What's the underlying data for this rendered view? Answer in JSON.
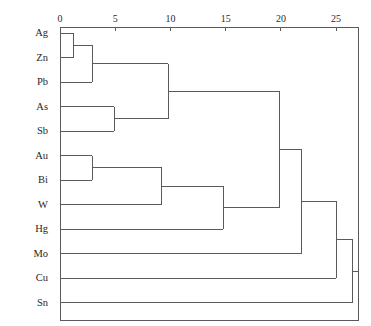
{
  "chart_data": {
    "type": "dendrogram",
    "title": "",
    "xlabel": "",
    "ylabel": "",
    "axis_position": "top",
    "grid": false,
    "legend": false,
    "xlim": [
      0,
      26.8
    ],
    "xticks": [
      0,
      5,
      10,
      15,
      20,
      25
    ],
    "xtick_labels": [
      "0",
      "5",
      "10",
      "15",
      "20",
      "25"
    ],
    "leaf_labels": [
      "Ag",
      "Zn",
      "Pb",
      "As",
      "Sb",
      "Au",
      "Bi",
      "W",
      "Hg",
      "Mo",
      "Cu",
      "Sn"
    ],
    "leaf_order": [
      "Ag",
      "Zn",
      "Pb",
      "As",
      "Sb",
      "Au",
      "Bi",
      "W",
      "Hg",
      "Mo",
      "Cu",
      "Sn"
    ],
    "orientation": "left-to-right",
    "line_color": "#5a5a5a",
    "axis_color": "#5a5a5a",
    "merges": [
      {
        "id": "m1",
        "left": "Ag",
        "right": "Zn",
        "height": 1.2,
        "members": [
          "Ag",
          "Zn"
        ]
      },
      {
        "id": "m2",
        "left": "m1",
        "right": "Pb",
        "height": 2.9,
        "members": [
          "Ag",
          "Zn",
          "Pb"
        ]
      },
      {
        "id": "m3",
        "left": "As",
        "right": "Sb",
        "height": 4.9,
        "members": [
          "As",
          "Sb"
        ]
      },
      {
        "id": "m4",
        "left": "m2",
        "right": "m3",
        "height": 9.8,
        "members": [
          "Ag",
          "Zn",
          "Pb",
          "As",
          "Sb"
        ]
      },
      {
        "id": "m5",
        "left": "Au",
        "right": "Bi",
        "height": 2.9,
        "members": [
          "Au",
          "Bi"
        ]
      },
      {
        "id": "m6",
        "left": "m5",
        "right": "W",
        "height": 9.2,
        "members": [
          "Au",
          "Bi",
          "W"
        ]
      },
      {
        "id": "m7",
        "left": "m6",
        "right": "Hg",
        "height": 14.8,
        "members": [
          "Au",
          "Bi",
          "W",
          "Hg"
        ]
      },
      {
        "id": "m8",
        "left": "m4",
        "right": "m7",
        "height": 19.9,
        "members": [
          "Ag",
          "Zn",
          "Pb",
          "As",
          "Sb",
          "Au",
          "Bi",
          "W",
          "Hg"
        ]
      },
      {
        "id": "m9",
        "left": "m8",
        "right": "Mo",
        "height": 21.9,
        "members": [
          "Ag",
          "Zn",
          "Pb",
          "As",
          "Sb",
          "Au",
          "Bi",
          "W",
          "Hg",
          "Mo"
        ]
      },
      {
        "id": "m10",
        "left": "m9",
        "right": "Cu",
        "height": 25.0,
        "members": [
          "Ag",
          "Zn",
          "Pb",
          "As",
          "Sb",
          "Au",
          "Bi",
          "W",
          "Hg",
          "Mo",
          "Cu"
        ]
      },
      {
        "id": "m11",
        "left": "m10",
        "right": "Sn",
        "height": 26.5,
        "members": [
          "Ag",
          "Zn",
          "Pb",
          "As",
          "Sb",
          "Au",
          "Bi",
          "W",
          "Hg",
          "Mo",
          "Cu",
          "Sn"
        ]
      }
    ]
  }
}
